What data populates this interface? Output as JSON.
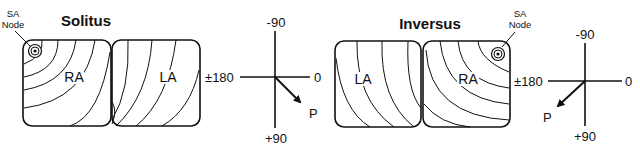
{
  "diagram": {
    "panels": [
      {
        "title": "Solitus",
        "sa_node_label": [
          "SA",
          "Node"
        ],
        "atria": [
          {
            "label": "RA",
            "side": "left"
          },
          {
            "label": "LA",
            "side": "right"
          }
        ],
        "axis": {
          "top": "-90",
          "bottom": "+90",
          "left": "±180",
          "right": "0",
          "vector_label": "P",
          "vector_direction": "down-right"
        }
      },
      {
        "title": "Inversus",
        "sa_node_label": [
          "SA",
          "Node"
        ],
        "atria": [
          {
            "label": "LA",
            "side": "left"
          },
          {
            "label": "RA",
            "side": "right"
          }
        ],
        "axis": {
          "top": "-90",
          "bottom": "+90",
          "left": "±180",
          "right": "0",
          "vector_label": "P",
          "vector_direction": "down-left"
        }
      }
    ],
    "colors": {
      "line": "#111111",
      "background": "#ffffff"
    }
  }
}
